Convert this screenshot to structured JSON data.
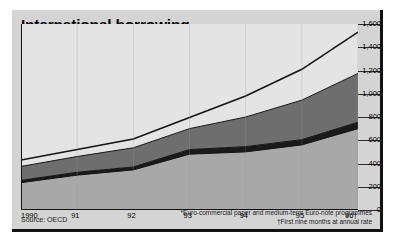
{
  "header": {
    "title": "International borrowing",
    "subtitle": "on the capital markets",
    "units": "new issues, $bn"
  },
  "legend": {
    "items": [
      {
        "label": "Uncommitted loans*",
        "color": "#e4e4e4",
        "name": "uncommitted-loans"
      },
      {
        "label": "Syndicated bank loans",
        "color": "#6e6e6e",
        "name": "syndicated-bank-loans"
      },
      {
        "label": "Equities",
        "color": "#1a1a1a",
        "name": "equities"
      },
      {
        "label": "Bonds",
        "color": "#a8a8a8",
        "name": "bonds"
      }
    ]
  },
  "footer": {
    "source": "Source: OECD",
    "footnote1": "*Euro-commercial paper and medium-term Euro-note programmes",
    "footnote2": "†First nine months at annual rate"
  },
  "chart_data": {
    "type": "area",
    "title": "International borrowing",
    "subtitle": "on the capital markets",
    "xlabel": "",
    "ylabel": "new issues, $bn",
    "stacked": true,
    "grid": true,
    "legend_position": "top-left",
    "x": [
      "1990",
      "91",
      "92",
      "93",
      "94",
      "95",
      "96†"
    ],
    "xtick_labels": [
      "1990",
      "91",
      "92",
      "93",
      "94",
      "95",
      "96†"
    ],
    "ylim": [
      0,
      1600
    ],
    "ytick_labels": [
      "0",
      "200",
      "400",
      "600",
      "800",
      "1,000",
      "1,200",
      "1,400",
      "1,600"
    ],
    "ytick_values": [
      0,
      200,
      400,
      600,
      800,
      1000,
      1200,
      1400,
      1600
    ],
    "series": [
      {
        "name": "Bonds",
        "color": "#a8a8a8",
        "values": [
          235,
          300,
          345,
          480,
          500,
          560,
          700
        ]
      },
      {
        "name": "Equities",
        "color": "#1a1a1a",
        "values": [
          20,
          25,
          25,
          40,
          45,
          45,
          55
        ]
      },
      {
        "name": "Syndicated bank loans",
        "color": "#6e6e6e",
        "values": [
          120,
          135,
          165,
          180,
          255,
          340,
          420
        ]
      },
      {
        "name": "Uncommitted loans*",
        "color": "#e4e4e4",
        "values": [
          55,
          60,
          75,
          95,
          180,
          265,
          355
        ]
      }
    ],
    "totals": [
      430,
      520,
      610,
      795,
      980,
      1210,
      1530
    ]
  }
}
